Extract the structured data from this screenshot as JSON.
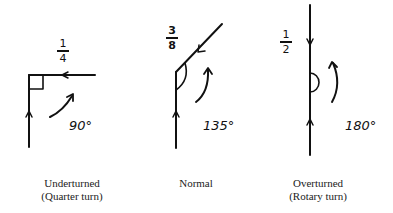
{
  "diagram": {
    "type": "turn-angle-comparison",
    "stroke_color": "#111111",
    "panels": [
      {
        "id": "underturned",
        "fraction": {
          "numerator": "1",
          "denominator": "4"
        },
        "angle_label": "90°",
        "caption_line1": "Underturned",
        "caption_line2": "(Quarter turn)"
      },
      {
        "id": "normal",
        "fraction": {
          "numerator": "3",
          "denominator": "8"
        },
        "angle_label": "135°",
        "caption_line1": "Normal",
        "caption_line2": ""
      },
      {
        "id": "overturned",
        "fraction": {
          "numerator": "1",
          "denominator": "2"
        },
        "angle_label": "180°",
        "caption_line1": "Overturned",
        "caption_line2": "(Rotary turn)"
      }
    ]
  }
}
